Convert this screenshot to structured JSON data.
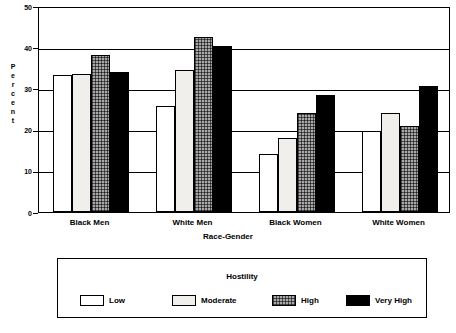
{
  "chart_data": {
    "type": "bar",
    "title": "",
    "xlabel": "Race-Gender",
    "ylabel": "Percent",
    "ylim": [
      0,
      50
    ],
    "yticks": [
      0,
      10,
      20,
      30,
      40,
      50
    ],
    "grid": true,
    "legend_position": "bottom",
    "legend_title": "Hostility",
    "categories": [
      "Black Men",
      "White Men",
      "Black Women",
      "White Women"
    ],
    "series": [
      {
        "name": "Low",
        "values": [
          33.3,
          25.8,
          14.2,
          19.7
        ],
        "color": "#ffffff",
        "pattern": "solid-white"
      },
      {
        "name": "Moderate",
        "values": [
          33.5,
          34.4,
          18.0,
          24.0
        ],
        "color": "#f0efec",
        "pattern": "solid-light-gray"
      },
      {
        "name": "High",
        "values": [
          38.0,
          42.4,
          24.0,
          20.9
        ],
        "color": "#a8a8a8",
        "pattern": "cross-hatch-gray"
      },
      {
        "name": "Very High",
        "values": [
          33.9,
          40.3,
          28.3,
          30.6
        ],
        "color": "#000000",
        "pattern": "solid-black"
      }
    ]
  },
  "axis": {
    "y_title_letters": [
      "P",
      "e",
      "r",
      "c",
      "e",
      "n",
      "t"
    ],
    "y_tick_labels": [
      "50",
      "40",
      "30",
      "20",
      "10",
      "0"
    ],
    "x_title": "Race-Gender",
    "x_tick_labels": [
      "Black Men",
      "White Men",
      "Black Women",
      "White Women"
    ]
  },
  "legend": {
    "title": "Hostility",
    "items": [
      {
        "label": "Low"
      },
      {
        "label": "Moderate"
      },
      {
        "label": "High"
      },
      {
        "label": "Very High"
      }
    ]
  }
}
